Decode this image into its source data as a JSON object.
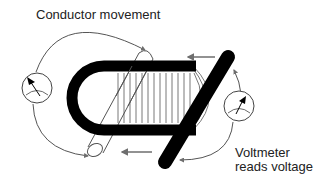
{
  "diagram": {
    "labels": {
      "conductor_movement": "Conductor movement",
      "voltmeter_line1": "Voltmeter",
      "voltmeter_line2": "reads voltage"
    },
    "elements": {
      "magnet": "U-shaped magnet",
      "field_lines": "magnetic field lines",
      "conductor_positions": [
        "conductor start (light, left)",
        "conductor current (dark, diagonal)"
      ],
      "voltmeters": [
        "left voltmeter",
        "right voltmeter"
      ],
      "arrows": [
        "movement arrow top",
        "movement arrow bottom",
        "circuit arrows"
      ]
    },
    "colors": {
      "magnet": "#000000",
      "arrow": "#6e6e6e",
      "line": "#555555",
      "text": "#222222"
    }
  }
}
